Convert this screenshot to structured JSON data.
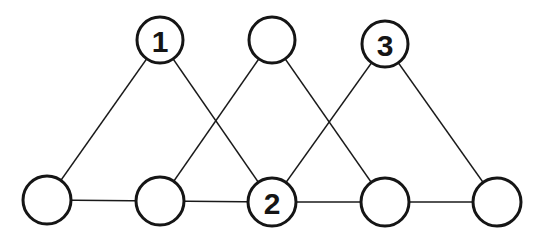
{
  "diagram": {
    "type": "graph",
    "nodes": [
      {
        "id": "t1",
        "label": "1",
        "x": 160,
        "y": 40,
        "r": 23
      },
      {
        "id": "t2",
        "label": "",
        "x": 272,
        "y": 40,
        "r": 23
      },
      {
        "id": "t3",
        "label": "3",
        "x": 385,
        "y": 44,
        "r": 23
      },
      {
        "id": "b1",
        "label": "",
        "x": 47,
        "y": 200,
        "r": 24
      },
      {
        "id": "b2",
        "label": "",
        "x": 160,
        "y": 201,
        "r": 24
      },
      {
        "id": "b3",
        "label": "2",
        "x": 272,
        "y": 202,
        "r": 24
      },
      {
        "id": "b4",
        "label": "",
        "x": 385,
        "y": 202,
        "r": 24
      },
      {
        "id": "b5",
        "label": "",
        "x": 497,
        "y": 202,
        "r": 24
      }
    ],
    "edges": [
      [
        "t1",
        "b1"
      ],
      [
        "t1",
        "b3"
      ],
      [
        "t2",
        "b2"
      ],
      [
        "t2",
        "b4"
      ],
      [
        "t3",
        "b3"
      ],
      [
        "t3",
        "b5"
      ],
      [
        "b1",
        "b2"
      ],
      [
        "b2",
        "b3"
      ],
      [
        "b3",
        "b4"
      ],
      [
        "b4",
        "b5"
      ]
    ]
  }
}
